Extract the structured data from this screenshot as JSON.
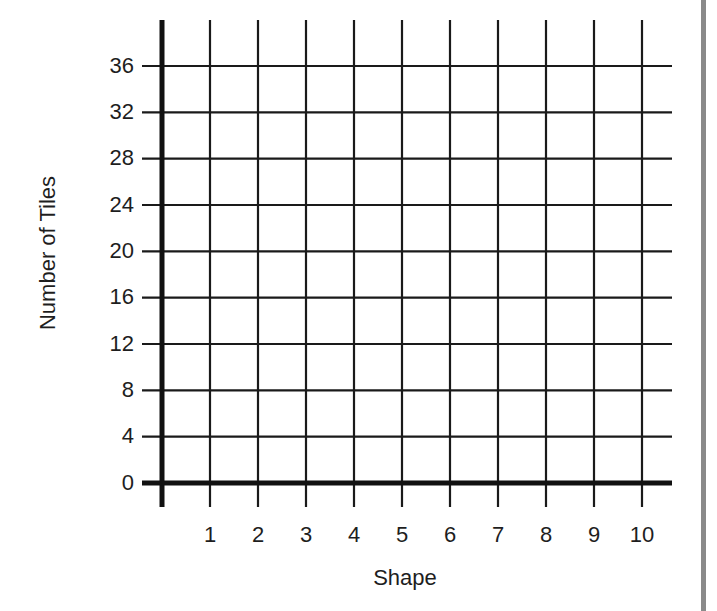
{
  "chart_data": {
    "type": "scatter",
    "title": "",
    "xlabel": "Shape",
    "ylabel": "Number of Tiles",
    "x_ticks": [
      "1",
      "2",
      "3",
      "4",
      "5",
      "6",
      "7",
      "8",
      "9",
      "10"
    ],
    "y_ticks": [
      "0",
      "4",
      "8",
      "12",
      "16",
      "20",
      "24",
      "28",
      "32",
      "36"
    ],
    "xlim": [
      0,
      10
    ],
    "ylim": [
      0,
      36
    ],
    "grid": true,
    "legend": null,
    "series": []
  },
  "colors": {
    "grid": "#1a1a1a",
    "axis": "#111111",
    "right_bar": "#8a8a8a",
    "background": "#ffffff"
  }
}
